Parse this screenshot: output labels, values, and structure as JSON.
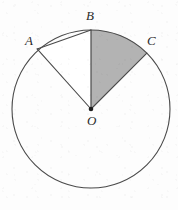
{
  "figure": {
    "background_color": "#fdfdfd",
    "stroke_color": "#4a4a4a",
    "shade_color": "#b3b3b3",
    "label_color": "#2b2b2b",
    "center": {
      "x": 91,
      "y": 109
    },
    "radius": 79,
    "labels": [
      {
        "name": "A",
        "text": "A",
        "x": 25,
        "y": 34,
        "point_x": 38,
        "point_y": 48
      },
      {
        "name": "B",
        "text": "B",
        "x": 86,
        "y": 9,
        "point_x": 91,
        "point_y": 30
      },
      {
        "name": "C",
        "text": "C",
        "x": 147,
        "y": 34,
        "point_x": 143,
        "point_y": 53
      },
      {
        "name": "O",
        "text": "O",
        "x": 87,
        "y": 114,
        "point_x": 91,
        "point_y": 109
      }
    ],
    "points": {
      "A": {
        "angle_deg": 133,
        "x": 38,
        "y": 49
      },
      "B": {
        "angle_deg": 90,
        "x": 91,
        "y": 30
      },
      "C": {
        "angle_deg": 45,
        "x": 147,
        "y": 53
      },
      "O": {
        "angle_deg": 0,
        "x": 91,
        "y": 109
      }
    },
    "segments": [
      {
        "name": "radius-OA",
        "from": "O",
        "to": "A"
      },
      {
        "name": "radius-OB",
        "from": "O",
        "to": "B"
      },
      {
        "name": "radius-OC",
        "from": "O",
        "to": "C"
      },
      {
        "name": "chord-AB",
        "from": "A",
        "to": "B"
      }
    ],
    "regions": [
      {
        "name": "sector-BOC",
        "shaded": true,
        "fill": "#b3b3b3"
      },
      {
        "name": "triangle-AOB",
        "shaded": false,
        "fill": "#ffffff"
      }
    ]
  }
}
